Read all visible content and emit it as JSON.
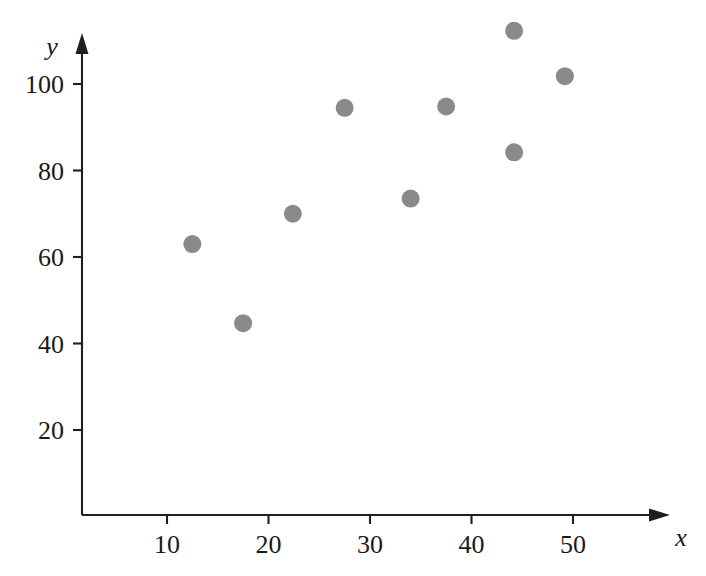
{
  "chart_data": {
    "type": "scatter",
    "title": "",
    "subtitle": "",
    "xlabel": "x",
    "ylabel": "y",
    "xlim": [
      0,
      56
    ],
    "ylim": [
      0,
      118
    ],
    "grid": false,
    "legend": null,
    "marker": {
      "shape": "circle",
      "color": "#8a8a8a",
      "size_px": 18
    },
    "axis_color": "#1f1f1f",
    "background_color": "#ffffff",
    "xticks": [
      10,
      20,
      30,
      40,
      50
    ],
    "xtick_labels": [
      "10",
      "20",
      "30",
      "40",
      "50"
    ],
    "yticks": [
      20,
      40,
      60,
      80,
      100
    ],
    "ytick_labels": [
      "20",
      "40",
      "60",
      "80",
      "100"
    ],
    "x": [
      12.5,
      17.5,
      22.4,
      27.5,
      34.0,
      37.5,
      44.2,
      44.4,
      44.2,
      49.2
    ],
    "y": [
      63.0,
      44.7,
      70.0,
      94.5,
      73.5,
      94.8,
      112.3,
      84.2,
      84.2,
      101.8
    ],
    "points": [
      {
        "x": 12.5,
        "y": 63.0
      },
      {
        "x": 17.5,
        "y": 44.7
      },
      {
        "x": 22.4,
        "y": 70.0
      },
      {
        "x": 27.5,
        "y": 94.5
      },
      {
        "x": 34.0,
        "y": 73.5
      },
      {
        "x": 37.5,
        "y": 94.8
      },
      {
        "x": 44.2,
        "y": 112.3
      },
      {
        "x": 44.2,
        "y": 84.2
      },
      {
        "x": 49.2,
        "y": 101.8
      }
    ]
  },
  "axes": {
    "y_axis_name": "y",
    "x_axis_name": "x"
  }
}
